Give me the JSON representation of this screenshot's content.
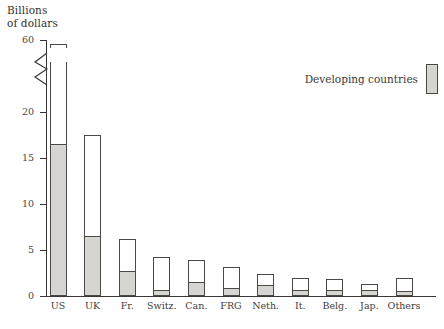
{
  "chart_data": {
    "type": "bar",
    "title": "",
    "ylabel": "Billions\nof dollars",
    "xlabel": "",
    "ylim": [
      0,
      60
    ],
    "axis_break": {
      "from": 20,
      "to": 60,
      "style": "zigzag"
    },
    "yticks": [
      0,
      5,
      10,
      15,
      20,
      60
    ],
    "ytick_labels": [
      "0",
      "5",
      "10",
      "15",
      "20",
      "60"
    ],
    "grid": false,
    "legend_position": "top-right",
    "stacked": true,
    "categories": [
      "US",
      "UK",
      "Fr.",
      "Switz.",
      "Can.",
      "FRG",
      "Neth.",
      "It.",
      "Belg.",
      "Jap.",
      "Others"
    ],
    "series": [
      {
        "name": "Developing countries",
        "color": "#d6d5d2",
        "values": [
          16.5,
          6.5,
          2.7,
          0.7,
          1.5,
          0.9,
          1.2,
          0.6,
          0.7,
          0.6,
          0.5
        ]
      },
      {
        "name": "Total",
        "color": "#ffffff",
        "values": [
          57.0,
          17.5,
          6.2,
          4.2,
          3.9,
          3.2,
          2.4,
          2.0,
          1.9,
          1.3,
          2.0
        ]
      }
    ]
  },
  "legend": {
    "entries": [
      {
        "label": "Developing countries",
        "swatch": "#d6d5d2"
      }
    ]
  },
  "caption": {
    "text": ""
  }
}
